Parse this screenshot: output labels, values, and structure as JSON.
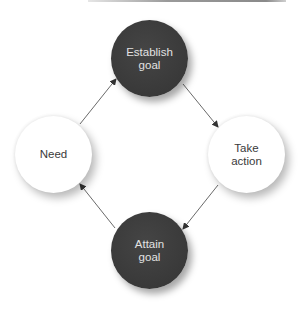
{
  "diagram": {
    "type": "cycle",
    "nodes": [
      {
        "id": "establish",
        "label": "Establish\ngoal",
        "style": "dark"
      },
      {
        "id": "take",
        "label": "Take\naction",
        "style": "light"
      },
      {
        "id": "attain",
        "label": "Attain\ngoal",
        "style": "dark"
      },
      {
        "id": "need",
        "label": "Need",
        "style": "light"
      }
    ],
    "edges": [
      {
        "from": "need",
        "to": "establish"
      },
      {
        "from": "establish",
        "to": "take"
      },
      {
        "from": "take",
        "to": "attain"
      },
      {
        "from": "attain",
        "to": "need"
      }
    ],
    "colors": {
      "dark_fill": "#3d3d3d",
      "dark_text": "#e2e2e2",
      "light_fill": "#ffffff",
      "light_text": "#3a3a3a",
      "arrow": "#555555"
    }
  }
}
